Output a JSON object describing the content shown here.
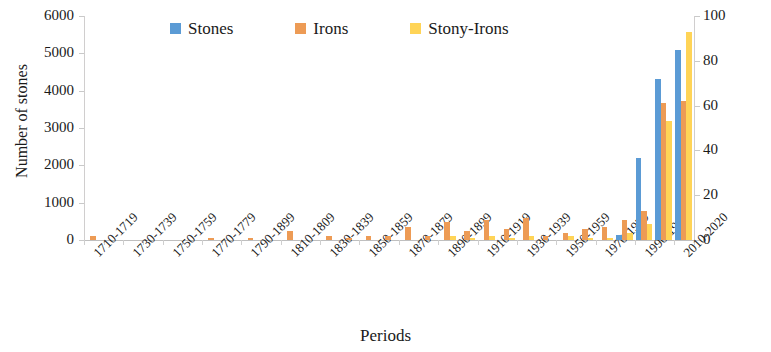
{
  "chart_data": {
    "type": "bar",
    "title": "",
    "xlabel": "Periods",
    "ylabel": "Number of stones",
    "ylabel_secondary": "Number of irons and stony-irons",
    "ylim": [
      0,
      6000
    ],
    "ylim_secondary": [
      0,
      100
    ],
    "yticks": [
      0,
      1000,
      2000,
      3000,
      4000,
      5000,
      6000
    ],
    "yticks_secondary": [
      0,
      20,
      40,
      60,
      80,
      100
    ],
    "grid": false,
    "legend_position": "top",
    "categories": [
      "1710-1719",
      "1720-1729",
      "1730-1739",
      "1740-1749",
      "1750-1759",
      "1760-1769",
      "1770-1779",
      "1780-1789",
      "1790-1899",
      "1800-1809",
      "1810-1809",
      "1820-1829",
      "1830-1839",
      "1840-1849",
      "1850-1859",
      "1860-1869",
      "1870-1879",
      "1880-1889",
      "1890-1899",
      "1900-1909",
      "1910-1919",
      "1920-1929",
      "1930-1939",
      "1940-1949",
      "1950-1959",
      "1960-1969",
      "1970-1979",
      "1980-1989",
      "1990-1999",
      "2000-2009",
      "2010-2020"
    ],
    "visible_tick_labels": [
      "1710-1719",
      "1730-1739",
      "1750-1759",
      "1770-1779",
      "1790-1899",
      "1810-1809",
      "1830-1839",
      "1850-1859",
      "1870-1879",
      "1890-1899",
      "1910-1919",
      "1930-1939",
      "1950-1959",
      "1970-1979",
      "1990-1999",
      "2010-2020"
    ],
    "series": [
      {
        "name": "Stones",
        "axis": "left",
        "color": "#5B9BD5",
        "values": [
          0,
          0,
          0,
          0,
          0,
          0,
          0,
          0,
          0,
          0,
          0,
          0,
          0,
          0,
          0,
          0,
          0,
          0,
          0,
          0,
          0,
          0,
          0,
          0,
          0,
          0,
          0,
          130,
          2200,
          4300,
          5100
        ]
      },
      {
        "name": "Irons",
        "axis": "right",
        "color": "#ED9B55",
        "values": [
          2,
          0,
          0,
          0,
          0,
          0,
          1,
          0,
          1,
          0,
          4,
          0,
          2,
          1,
          2,
          2,
          6,
          2,
          8,
          4,
          9,
          5,
          10,
          2,
          3,
          5,
          6,
          9,
          13,
          61,
          62
        ]
      },
      {
        "name": "Stony-Irons",
        "axis": "right",
        "color": "#FFD457",
        "values": [
          0,
          0,
          0,
          0,
          0,
          0,
          0,
          0,
          0,
          0,
          0,
          0,
          0,
          0,
          0,
          0,
          0,
          0,
          2,
          1,
          2,
          1,
          2,
          0,
          2,
          1,
          1,
          3,
          7,
          53,
          93
        ]
      }
    ]
  },
  "legend": {
    "items": [
      {
        "label": "Stones",
        "color": "#5B9BD5",
        "icon": "legend-swatch-icon"
      },
      {
        "label": "Irons",
        "color": "#ED9B55",
        "icon": "legend-swatch-icon"
      },
      {
        "label": "Stony-Irons",
        "color": "#FFD457",
        "icon": "legend-swatch-icon"
      }
    ]
  }
}
